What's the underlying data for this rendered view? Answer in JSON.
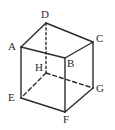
{
  "figure": {
    "name": "labeled-cube-diagram",
    "background_color": "#ffffff",
    "stroke_color": "#2b2b2b",
    "hidden_stroke_color": "#2b2b2b",
    "canvas": {
      "width": 115,
      "height": 130
    },
    "vertices": [
      {
        "id": "A",
        "label": "A",
        "x": 21,
        "y": 47,
        "label_x": 8,
        "label_y": 41,
        "hidden": false
      },
      {
        "id": "B",
        "label": "B",
        "x": 65,
        "y": 58,
        "label_x": 67,
        "label_y": 58,
        "hidden": false
      },
      {
        "id": "C",
        "label": "C",
        "x": 93,
        "y": 42,
        "label_x": 96,
        "label_y": 33,
        "hidden": false
      },
      {
        "id": "D",
        "label": "D",
        "x": 46,
        "y": 23,
        "label_x": 41,
        "label_y": 9,
        "hidden": false
      },
      {
        "id": "E",
        "label": "E",
        "x": 21,
        "y": 98,
        "label_x": 8,
        "label_y": 92,
        "hidden": false
      },
      {
        "id": "F",
        "label": "F",
        "x": 65,
        "y": 112,
        "label_x": 63,
        "label_y": 114,
        "hidden": false
      },
      {
        "id": "G",
        "label": "G",
        "x": 93,
        "y": 88,
        "label_x": 96,
        "label_y": 83,
        "hidden": false
      },
      {
        "id": "H",
        "label": "H",
        "x": 46,
        "y": 73,
        "label_x": 35,
        "label_y": 62,
        "hidden": true
      }
    ],
    "edges": [
      {
        "from": "A",
        "to": "D",
        "style": "solid"
      },
      {
        "from": "D",
        "to": "C",
        "style": "solid"
      },
      {
        "from": "C",
        "to": "B",
        "style": "solid"
      },
      {
        "from": "B",
        "to": "A",
        "style": "solid"
      },
      {
        "from": "A",
        "to": "E",
        "style": "solid"
      },
      {
        "from": "C",
        "to": "G",
        "style": "solid"
      },
      {
        "from": "B",
        "to": "F",
        "style": "solid"
      },
      {
        "from": "E",
        "to": "F",
        "style": "solid"
      },
      {
        "from": "F",
        "to": "G",
        "style": "solid"
      },
      {
        "from": "D",
        "to": "H",
        "style": "dotted"
      },
      {
        "from": "H",
        "to": "E",
        "style": "dashed"
      },
      {
        "from": "H",
        "to": "G",
        "style": "dashed"
      }
    ]
  }
}
